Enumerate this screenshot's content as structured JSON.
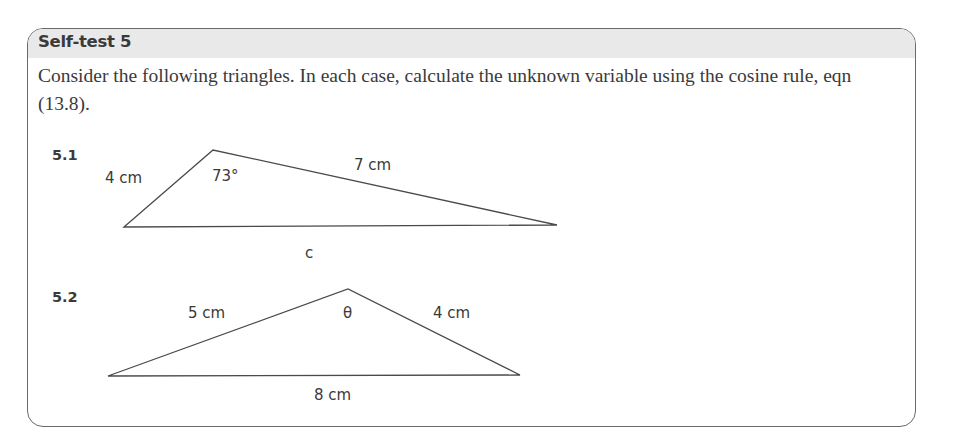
{
  "header": {
    "title": "Self-test 5"
  },
  "prompt": "Consider the following triangles. In each case, calculate the unknown variable using the cosine rule, eqn (13.8).",
  "questions": [
    {
      "number": "5.1",
      "labels": {
        "left_side": "4 cm",
        "angle": "73°",
        "right_side": "7 cm",
        "base": "c"
      }
    },
    {
      "number": "5.2",
      "labels": {
        "left_side": "5 cm",
        "angle": "θ",
        "right_side": "4 cm",
        "base": "8 cm"
      }
    }
  ],
  "colors": {
    "header_bg": "#e9e9e9",
    "border": "#6a6a6a",
    "text": "#3a3a3a"
  }
}
